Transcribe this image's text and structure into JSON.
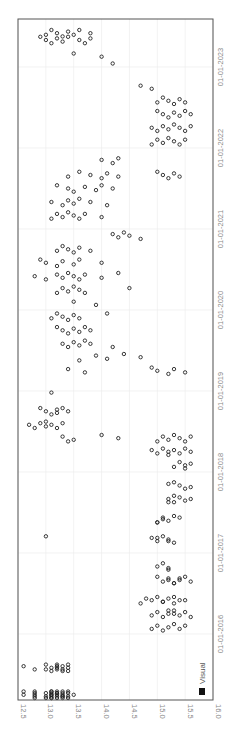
{
  "chart_data": {
    "type": "scatter",
    "title": "",
    "xlabel": "",
    "ylabel": "",
    "orientation": "rotated-90-clockwise",
    "x_axis": {
      "kind": "date",
      "tick_labels": [
        "01-01-2016",
        "01-01-2017",
        "01-01-2018",
        "01-01-2019",
        "01-01-2020",
        "01-01-2021",
        "01-01-2022",
        "01-01-2023"
      ],
      "range": [
        "2015-03-10",
        "2023-07-20"
      ]
    },
    "y_axis": {
      "tick_labels": [
        "12.5",
        "13.0",
        "13.5",
        "14.0",
        "14.5",
        "15.0",
        "15.5",
        "16.0"
      ],
      "ylim": [
        12.5,
        16.0
      ]
    },
    "grid": true,
    "legend": {
      "position": "bottom-right",
      "entries": [
        {
          "name": "Visual",
          "color": "#111111"
        }
      ]
    },
    "series": [
      {
        "name": "Visual",
        "marker": "open-circle",
        "color": "#222222",
        "points": [
          {
            "date": "2015-04",
            "values": [
              12.6,
              12.6,
              12.8,
              12.8,
              12.8,
              12.8,
              12.8,
              13.0,
              13.0,
              13.0,
              13.1,
              13.1,
              13.1,
              13.1,
              13.1,
              13.1,
              13.1,
              13.2,
              13.2,
              13.2,
              13.2,
              13.2,
              13.3,
              13.3,
              13.3,
              13.3,
              13.3,
              13.4,
              13.4,
              13.4,
              13.4,
              13.5,
              13.1,
              13.2,
              13.3
            ]
          },
          {
            "date": "2015-08",
            "values": [
              13.0,
              13.0,
              13.1,
              13.1,
              13.2,
              13.2,
              13.2,
              13.2,
              13.3,
              13.3,
              13.3,
              13.4,
              13.4,
              13.4,
              12.6,
              12.8
            ]
          },
          {
            "date": "2016-02",
            "values": [
              15.5,
              15.4,
              15.3,
              15.2,
              15.1,
              15.0,
              14.9
            ]
          },
          {
            "date": "2016-04",
            "values": [
              15.6,
              15.5,
              15.4,
              15.3,
              15.2,
              15.1,
              15.0,
              14.9,
              15.2,
              15.3
            ]
          },
          {
            "date": "2016-06",
            "values": [
              15.4,
              15.3,
              15.2,
              15.1,
              15.0,
              14.9,
              14.7,
              14.8,
              15.1,
              15.3,
              15.5
            ]
          },
          {
            "date": "2016-09",
            "values": [
              15.5,
              15.4,
              15.3,
              15.2,
              15.1,
              15.0,
              15.2,
              15.3,
              15.4,
              15.6
            ]
          },
          {
            "date": "2016-11",
            "values": [
              15.2,
              15.1,
              15.0,
              15.2
            ]
          },
          {
            "date": "2017-03",
            "values": [
              14.9,
              15.0,
              15.1,
              15.2,
              15.3,
              15.0,
              15.2,
              13.0
            ]
          },
          {
            "date": "2017-06",
            "values": [
              15.0,
              15.1,
              15.2,
              15.3,
              15.1,
              15.0,
              15.4
            ]
          },
          {
            "date": "2017-09",
            "values": [
              15.2,
              15.3,
              15.4,
              15.5,
              15.3,
              15.6,
              15.2
            ]
          },
          {
            "date": "2017-11",
            "values": [
              15.3,
              15.4,
              15.5,
              15.2,
              15.6
            ]
          },
          {
            "date": "2018-02",
            "values": [
              15.3,
              15.4,
              15.5,
              15.5,
              15.6
            ]
          },
          {
            "date": "2018-04",
            "values": [
              14.9,
              15.0,
              15.1,
              15.2,
              15.2,
              15.3,
              15.4,
              15.5,
              15.6
            ]
          },
          {
            "date": "2018-06",
            "values": [
              13.4,
              13.3,
              13.5,
              14.0,
              14.3,
              15.0,
              15.1,
              15.2,
              15.3,
              15.4,
              15.5,
              15.6
            ]
          },
          {
            "date": "2018-08",
            "values": [
              12.7,
              12.8,
              12.9,
              13.0,
              13.0,
              13.1,
              13.2,
              13.3
            ]
          },
          {
            "date": "2018-10",
            "values": [
              12.9,
              13.0,
              13.1,
              13.2,
              13.2,
              13.3,
              13.4
            ]
          },
          {
            "date": "2019-01",
            "values": [
              13.1
            ]
          },
          {
            "date": "2019-04",
            "values": [
              13.4,
              13.7,
              14.9,
              15.0,
              15.2,
              15.3,
              15.5
            ]
          },
          {
            "date": "2019-06",
            "values": [
              13.6,
              13.9,
              14.1,
              14.4,
              14.7
            ]
          },
          {
            "date": "2019-08",
            "values": [
              13.3,
              13.4,
              13.5,
              13.6,
              13.7,
              13.8,
              14.2
            ]
          },
          {
            "date": "2019-10",
            "values": [
              13.2,
              13.3,
              13.4,
              13.5,
              13.6,
              13.7,
              13.8
            ]
          },
          {
            "date": "2019-12",
            "values": [
              13.1,
              13.2,
              13.3,
              13.4,
              13.5,
              13.6,
              14.1
            ]
          },
          {
            "date": "2020-02",
            "values": [
              13.5,
              13.9
            ]
          },
          {
            "date": "2020-04",
            "values": [
              13.2,
              13.3,
              13.4,
              13.5,
              13.6,
              13.7,
              14.5
            ]
          },
          {
            "date": "2020-06",
            "values": [
              12.8,
              13.0,
              13.2,
              13.3,
              13.4,
              13.5,
              13.6,
              13.7,
              14.0,
              14.3
            ]
          },
          {
            "date": "2020-08",
            "values": [
              12.9,
              13.0,
              13.2,
              13.3,
              13.5,
              13.6,
              14.0
            ]
          },
          {
            "date": "2020-10",
            "values": [
              13.2,
              13.3,
              13.4,
              13.5,
              13.6,
              13.8
            ]
          },
          {
            "date": "2020-12",
            "values": [
              14.2,
              14.3,
              14.4,
              14.5,
              14.7
            ]
          },
          {
            "date": "2021-03",
            "values": [
              13.1,
              13.2,
              13.3,
              13.4,
              13.5,
              13.6,
              13.7,
              14.0
            ]
          },
          {
            "date": "2021-05",
            "values": [
              13.1,
              13.3,
              13.4,
              13.5,
              13.6,
              13.8,
              14.1
            ]
          },
          {
            "date": "2021-07",
            "values": [
              13.2,
              13.4,
              13.5,
              13.7,
              13.9,
              14.0,
              14.2
            ]
          },
          {
            "date": "2021-09",
            "values": [
              13.4,
              13.6,
              13.8,
              14.0,
              14.1,
              14.3,
              15.0,
              15.1,
              15.2,
              15.3,
              15.4
            ]
          },
          {
            "date": "2021-11",
            "values": [
              14.0,
              14.2,
              14.3
            ]
          },
          {
            "date": "2022-02",
            "values": [
              14.9,
              15.0,
              15.1,
              15.2,
              15.3,
              15.4,
              15.5
            ]
          },
          {
            "date": "2022-04",
            "values": [
              14.9,
              15.0,
              15.1,
              15.2,
              15.3,
              15.4,
              15.5,
              15.6
            ]
          },
          {
            "date": "2022-06",
            "values": [
              15.0,
              15.1,
              15.2,
              15.3,
              15.4,
              15.5,
              15.6
            ]
          },
          {
            "date": "2022-08",
            "values": [
              15.0,
              15.1,
              15.2,
              15.3,
              15.4,
              15.5
            ]
          },
          {
            "date": "2022-10",
            "values": [
              14.7,
              14.9
            ]
          },
          {
            "date": "2023-02",
            "values": [
              14.2
            ]
          },
          {
            "date": "2023-03",
            "values": [
              13.5,
              14.0
            ]
          },
          {
            "date": "2023-05",
            "values": [
              12.9,
              13.0,
              13.1,
              13.2,
              13.3,
              13.4,
              13.6,
              13.7,
              13.8
            ]
          },
          {
            "date": "2023-06",
            "values": [
              13.0,
              13.1,
              13.2,
              13.3,
              13.4,
              13.5,
              13.6,
              13.8
            ]
          }
        ]
      }
    ]
  },
  "legend": {
    "label": "Visual"
  },
  "colors": {
    "marker": "#222222",
    "frame": "#555555",
    "grid": "#ececec",
    "tick_text": "#8a8a8a"
  }
}
